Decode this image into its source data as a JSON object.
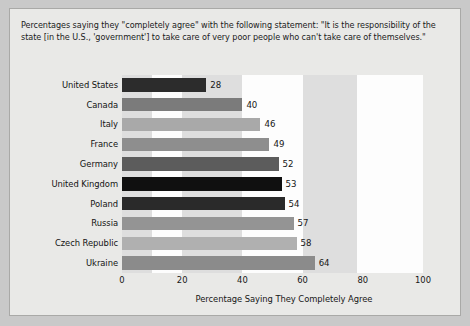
{
  "figure": {
    "caption_lines": [
      "Percentages saying they \"completely agree\" with the following statement: \"It is the responsibility of the",
      "state [in the U.S., 'government'] to take care of very poor people who can't take care of themselves.\""
    ],
    "background_color": "#e9e9e7",
    "plot_background_color": "#dedede",
    "band_color": "#fdfdfd"
  },
  "chart_data": {
    "type": "bar",
    "orientation": "horizontal",
    "xlabel": "Percentage Saying They Completely Agree",
    "ylabel": "",
    "xlim": [
      0,
      100
    ],
    "xticks": [
      0,
      20,
      40,
      60,
      80,
      100
    ],
    "grid": false,
    "legend": null,
    "categories": [
      "United States",
      "Canada",
      "Italy",
      "France",
      "Germany",
      "United Kingdom",
      "Poland",
      "Russia",
      "Czech Republic",
      "Ukraine"
    ],
    "values": [
      28,
      40,
      46,
      49,
      52,
      53,
      54,
      57,
      58,
      64
    ],
    "bar_colors": [
      "#2c2c2c",
      "#7b7b7b",
      "#a9a9a9",
      "#8e8e8e",
      "#5c5c5c",
      "#101010",
      "#2a2a2a",
      "#949494",
      "#b0b0b0",
      "#8b8b8b"
    ]
  }
}
